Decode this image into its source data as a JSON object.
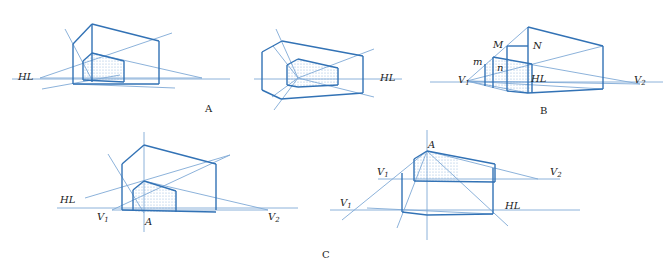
{
  "figure": {
    "captions": {
      "A": "A",
      "B": "B",
      "C": "C"
    },
    "colors": {
      "line": "#3a7bbf",
      "line_strong": "#3272b5",
      "shade_dot": "#8fb3dc",
      "text": "#222222"
    },
    "panels": [
      {
        "id": "A-left",
        "labels": [
          {
            "text": "HL",
            "x": 18,
            "y": 80
          }
        ],
        "strong": [
          "92,24 159,41",
          "92,24 92,82",
          "159,41 159,84",
          "73,44 73,84",
          "73,44 92,24",
          "92,53 124,61",
          "83,61 92,53",
          "83,61 83,80",
          "124,61 124,82",
          "83,80 124,82",
          "73,84 92,84 159,84"
        ],
        "light": [
          "12,79 230,79",
          "40,78 172,33",
          "40,78 202,78",
          "65,29 92,80",
          "42,89 120,75",
          "73,84 175,88",
          "92,53 202,78"
        ],
        "shade": "83,61 92,53 124,61 124,82 83,80"
      },
      {
        "id": "A-right",
        "labels": [
          {
            "text": "HL",
            "x": 380,
            "y": 81
          }
        ],
        "strong": [
          "282,41 363,56",
          "363,56 363,93",
          "282,41 262,52",
          "262,52 262,90",
          "262,90 281,99",
          "281,99 363,93",
          "298,59 338,68",
          "338,68 338,85",
          "298,59 287,65",
          "287,65 287,85",
          "287,85 298,87",
          "298,87 338,85"
        ],
        "light": [
          "254,79 402,79",
          "298,78 276,29",
          "298,78 374,49",
          "298,78 374,97",
          "298,78 274,110",
          "298,78 273,46",
          "298,78 272,97"
        ],
        "shade": "287,65 298,59 338,68 338,85 298,87 287,85"
      },
      {
        "id": "B",
        "labels": [
          {
            "text": "M",
            "x": 493,
            "y": 48
          },
          {
            "text": "N",
            "x": 533,
            "y": 49
          },
          {
            "text": "m",
            "x": 473,
            "y": 65
          },
          {
            "text": "n",
            "x": 497,
            "y": 71
          },
          {
            "text": "V",
            "sub": "1",
            "x": 458,
            "y": 83
          },
          {
            "text": "HL",
            "x": 531,
            "y": 82
          },
          {
            "text": "V",
            "sub": "2",
            "x": 634,
            "y": 83
          }
        ],
        "strong": [
          "528,27 603,46",
          "528,27 528,93",
          "603,46 603,89",
          "528,93 603,89",
          "507,46 528,46",
          "507,46 507,91",
          "493,57 532,64",
          "493,57 493,88",
          "485,64 485,86",
          "532,64 532,93",
          "507,91 528,93"
        ],
        "light": [
          "430,82 663,82",
          "467,81 528,27",
          "467,81 603,46",
          "467,81 640,84",
          "467,81 507,91",
          "467,81 528,93",
          "528,64 640,84",
          "467,81 603,89"
        ],
        "shade": "485,64 493,57 532,64 532,93 485,86"
      },
      {
        "id": "C-left",
        "labels": [
          {
            "text": "HL",
            "x": 60,
            "y": 203
          },
          {
            "text": "V",
            "sub": "1",
            "x": 97,
            "y": 220
          },
          {
            "text": "A",
            "x": 145,
            "y": 225
          },
          {
            "text": "V",
            "sub": "2",
            "x": 268,
            "y": 220
          }
        ],
        "strong": [
          "144,145 216,164",
          "144,145 122,164",
          "122,164 122,210",
          "216,164 216,210",
          "144,181 176,191",
          "144,181 133,190",
          "133,190 133,211",
          "176,191 176,212",
          "122,210 216,212"
        ],
        "light": [
          "57,208 298,208",
          "144,132 144,232",
          "85,198 230,155",
          "112,210 230,155",
          "108,154 144,213",
          "144,181 268,210",
          "112,210 268,210"
        ],
        "shade": "133,190 144,181 176,191 176,212 144,213 133,211"
      },
      {
        "id": "C-right",
        "labels": [
          {
            "text": "A",
            "x": 428,
            "y": 148
          },
          {
            "text": "V",
            "sub": "1",
            "x": 377,
            "y": 175
          },
          {
            "text": "V",
            "sub": "2",
            "x": 550,
            "y": 175
          },
          {
            "text": "V",
            "sub": "1",
            "x": 340,
            "y": 206
          },
          {
            "text": "HL",
            "x": 505,
            "y": 209
          }
        ],
        "strong": [
          "427,151 495,164",
          "427,151 414,159",
          "414,159 414,181",
          "495,164 495,182",
          "414,181 495,182",
          "402,173 402,212",
          "493,168 493,214",
          "402,212 427,215",
          "427,215 493,214"
        ],
        "light": [
          "378,179 560,179",
          "330,210 580,210",
          "427,130 427,240",
          "427,151 342,220",
          "427,151 397,228",
          "427,151 508,226",
          "427,151 538,179",
          "367,208 493,214"
        ],
        "shade": "414,159 427,151 459,159 459,182 414,181"
      }
    ],
    "caption_positions": {
      "A": {
        "x": 205,
        "y": 112
      },
      "B": {
        "x": 540,
        "y": 114
      },
      "C": {
        "x": 322,
        "y": 258
      }
    }
  }
}
